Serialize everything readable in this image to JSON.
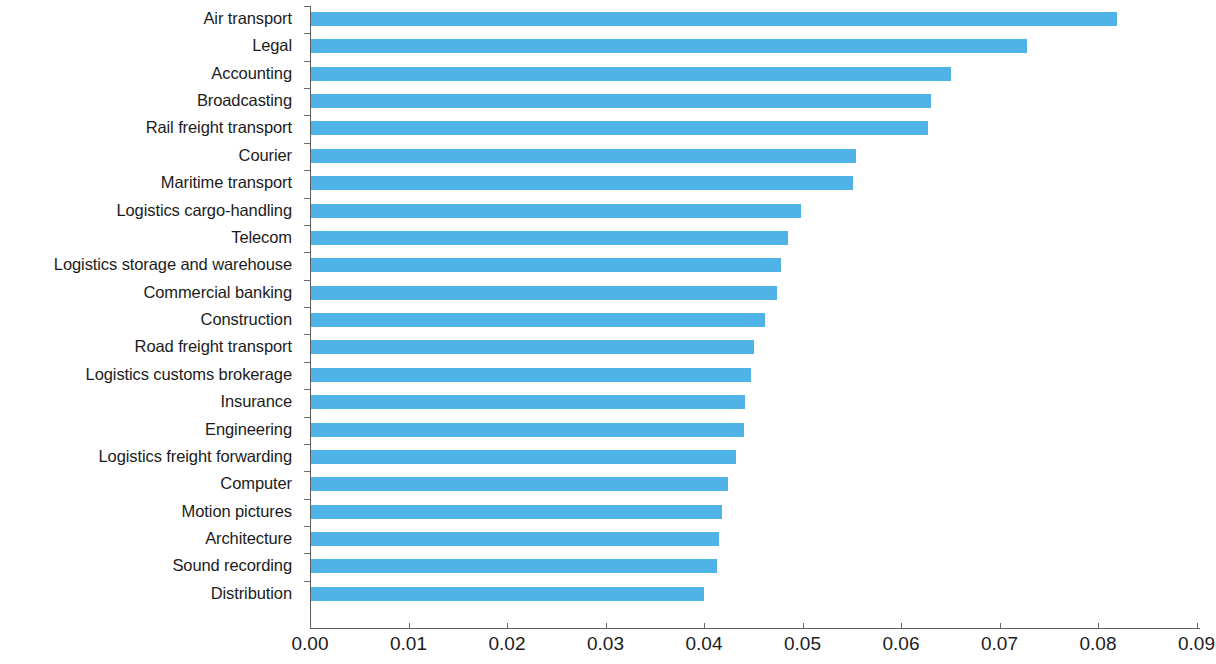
{
  "chart_data": {
    "type": "bar",
    "orientation": "horizontal",
    "title": "",
    "subtitle": "",
    "xlabel": "",
    "ylabel": "",
    "xlim": [
      0.0,
      0.09
    ],
    "grid": false,
    "legend": null,
    "bar_color": "#4FB3E8",
    "axis_color": "#5b5b5b",
    "text_color": "#1c1c1c",
    "background": "#ffffff",
    "xticks": [
      "0.00",
      "0.01",
      "0.02",
      "0.03",
      "0.04",
      "0.05",
      "0.06",
      "0.07",
      "0.08",
      "0.09"
    ],
    "xtick_values": [
      0.0,
      0.01,
      0.02,
      0.03,
      0.04,
      0.05,
      0.06,
      0.07,
      0.08,
      0.09
    ],
    "categories": [
      "Air transport",
      "Legal",
      "Accounting",
      "Broadcasting",
      "Rail freight transport",
      "Courier",
      "Maritime transport",
      "Logistics cargo-handling",
      "Telecom",
      "Logistics storage and warehouse",
      "Commercial banking",
      "Construction",
      "Road freight transport",
      "Logistics customs brokerage",
      "Insurance",
      "Engineering",
      "Logistics freight forwarding",
      "Computer",
      "Motion pictures",
      "Architecture",
      "Sound recording",
      "Distribution"
    ],
    "values": [
      0.0818,
      0.0727,
      0.065,
      0.0629,
      0.0626,
      0.0553,
      0.055,
      0.0497,
      0.0484,
      0.0477,
      0.0473,
      0.0461,
      0.045,
      0.0447,
      0.0441,
      0.044,
      0.0431,
      0.0423,
      0.0417,
      0.0414,
      0.0412,
      0.0399
    ]
  }
}
